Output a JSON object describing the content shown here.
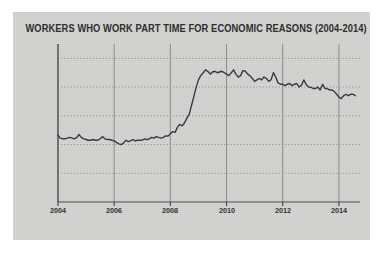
{
  "card": {
    "background_color": "#d4d4d2",
    "page_background_color": "#ffffff"
  },
  "chart_data": {
    "type": "line",
    "title": "WORKERS WHO WORK PART TIME FOR ECONOMIC REASONS (2004-2014)",
    "xlabel": "",
    "ylabel": "",
    "xlim": [
      2004,
      2014.75
    ],
    "ylim": [
      0,
      11
    ],
    "grid": true,
    "grid_style": {
      "horizontal": "dotted",
      "vertical": "solid",
      "color": "#8a8a88"
    },
    "legend": null,
    "line_color": "#3a3a3a",
    "line_width": 1.4,
    "ytick_labels": [
      "2 million",
      "4 million",
      "6 million",
      "8 million",
      "10 million"
    ],
    "ytick_values": [
      2,
      4,
      6,
      8,
      10
    ],
    "xtick_labels": [
      "2004",
      "2006",
      "2008",
      "2010",
      "2012",
      "2014"
    ],
    "xtick_values": [
      2004,
      2006,
      2008,
      2010,
      2012,
      2014
    ],
    "series": [
      {
        "name": "Part time for economic reasons",
        "units": "millions of workers",
        "x": [
          2004.0,
          2004.08,
          2004.17,
          2004.25,
          2004.33,
          2004.42,
          2004.5,
          2004.58,
          2004.67,
          2004.75,
          2004.83,
          2004.92,
          2005.0,
          2005.08,
          2005.17,
          2005.25,
          2005.33,
          2005.42,
          2005.5,
          2005.58,
          2005.67,
          2005.75,
          2005.83,
          2005.92,
          2006.0,
          2006.08,
          2006.17,
          2006.25,
          2006.33,
          2006.42,
          2006.5,
          2006.58,
          2006.67,
          2006.75,
          2006.83,
          2006.92,
          2007.0,
          2007.08,
          2007.17,
          2007.25,
          2007.33,
          2007.42,
          2007.5,
          2007.58,
          2007.67,
          2007.75,
          2007.83,
          2007.92,
          2008.0,
          2008.08,
          2008.17,
          2008.25,
          2008.33,
          2008.42,
          2008.5,
          2008.58,
          2008.67,
          2008.75,
          2008.83,
          2008.92,
          2009.0,
          2009.08,
          2009.17,
          2009.25,
          2009.33,
          2009.42,
          2009.5,
          2009.58,
          2009.67,
          2009.75,
          2009.83,
          2009.92,
          2010.0,
          2010.08,
          2010.17,
          2010.25,
          2010.33,
          2010.42,
          2010.5,
          2010.58,
          2010.67,
          2010.75,
          2010.83,
          2010.92,
          2011.0,
          2011.08,
          2011.17,
          2011.25,
          2011.33,
          2011.42,
          2011.5,
          2011.58,
          2011.67,
          2011.75,
          2011.83,
          2011.92,
          2012.0,
          2012.08,
          2012.17,
          2012.25,
          2012.33,
          2012.42,
          2012.5,
          2012.58,
          2012.67,
          2012.75,
          2012.83,
          2012.92,
          2013.0,
          2013.08,
          2013.17,
          2013.25,
          2013.33,
          2013.42,
          2013.5,
          2013.58,
          2013.67,
          2013.75,
          2013.83,
          2013.92,
          2014.0,
          2014.08,
          2014.17,
          2014.25,
          2014.33,
          2014.42,
          2014.5,
          2014.58
        ],
        "values": [
          4.65,
          4.45,
          4.4,
          4.4,
          4.45,
          4.5,
          4.45,
          4.4,
          4.5,
          4.7,
          4.5,
          4.4,
          4.35,
          4.3,
          4.3,
          4.35,
          4.3,
          4.3,
          4.4,
          4.55,
          4.4,
          4.35,
          4.35,
          4.3,
          4.25,
          4.15,
          4.05,
          4.0,
          4.1,
          4.3,
          4.2,
          4.25,
          4.35,
          4.25,
          4.3,
          4.3,
          4.3,
          4.4,
          4.35,
          4.4,
          4.5,
          4.45,
          4.55,
          4.5,
          4.45,
          4.5,
          4.6,
          4.6,
          4.75,
          4.9,
          4.85,
          5.2,
          5.4,
          5.3,
          5.5,
          5.8,
          6.1,
          6.7,
          7.3,
          8.0,
          8.5,
          8.8,
          9.0,
          9.2,
          9.1,
          8.9,
          9.05,
          9.1,
          9.0,
          9.05,
          9.1,
          9.0,
          8.9,
          8.8,
          9.0,
          9.2,
          8.9,
          8.7,
          8.8,
          9.15,
          9.1,
          8.9,
          8.8,
          8.6,
          8.4,
          8.5,
          8.6,
          8.5,
          8.7,
          8.6,
          8.4,
          8.5,
          9.0,
          8.7,
          8.3,
          8.2,
          8.2,
          8.1,
          8.2,
          8.25,
          8.1,
          8.2,
          8.25,
          8.0,
          8.15,
          8.5,
          8.2,
          8.0,
          8.0,
          7.9,
          7.9,
          8.0,
          7.8,
          8.2,
          7.9,
          7.9,
          7.8,
          7.8,
          7.7,
          7.5,
          7.3,
          7.2,
          7.4,
          7.5,
          7.4,
          7.5,
          7.5,
          7.4
        ]
      }
    ]
  }
}
